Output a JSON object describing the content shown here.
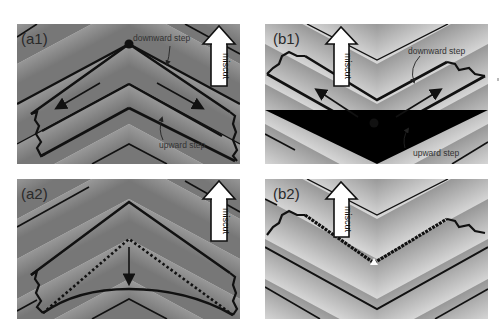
{
  "figure": {
    "panels": [
      {
        "id": "a1",
        "label": "(a1)",
        "arrow_label": "miscut",
        "annotations": {
          "downward": "downward step",
          "upward": "upward step"
        }
      },
      {
        "id": "b1",
        "label": "(b1)",
        "arrow_label": "miscut",
        "annotations": {
          "downward": "downward step",
          "upward": "upward step"
        }
      },
      {
        "id": "a2",
        "label": "(a2)",
        "arrow_label": "miscut"
      },
      {
        "id": "b2",
        "label": "(b2)",
        "arrow_label": "miscut"
      }
    ],
    "colors": {
      "background": "#ffffff",
      "step_line": "#111111",
      "terrace_dark": "#7a7a7a",
      "terrace_light": "#f2f2f2",
      "arrow_fill": "#ffffff"
    }
  }
}
